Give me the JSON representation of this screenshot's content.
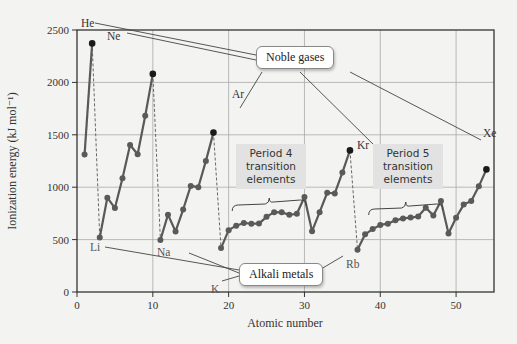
{
  "chart_data": {
    "type": "line",
    "title": "",
    "xlabel": "Atomic number",
    "ylabel": "Ionization energy (kJ mol⁻¹)",
    "xlim": [
      0,
      55
    ],
    "ylim": [
      0,
      2500
    ],
    "x_ticks": [
      0,
      10,
      20,
      30,
      40,
      50
    ],
    "y_ticks": [
      0,
      500,
      1000,
      1500,
      2000,
      2500
    ],
    "grid": true,
    "x": [
      1,
      2,
      3,
      4,
      5,
      6,
      7,
      8,
      9,
      10,
      11,
      12,
      13,
      14,
      15,
      16,
      17,
      18,
      19,
      20,
      21,
      22,
      23,
      24,
      25,
      26,
      27,
      28,
      29,
      30,
      31,
      32,
      33,
      34,
      35,
      36,
      37,
      38,
      39,
      40,
      41,
      42,
      43,
      44,
      45,
      46,
      47,
      48,
      49,
      50,
      51,
      52,
      53,
      54
    ],
    "values": [
      1312,
      2372,
      520,
      900,
      801,
      1086,
      1402,
      1314,
      1681,
      2081,
      496,
      738,
      578,
      787,
      1012,
      1000,
      1251,
      1521,
      419,
      590,
      633,
      659,
      651,
      653,
      717,
      762,
      760,
      737,
      746,
      906,
      579,
      762,
      947,
      941,
      1140,
      1351,
      403,
      550,
      600,
      640,
      652,
      684,
      702,
      710,
      720,
      804,
      731,
      868,
      558,
      709,
      834,
      869,
      1008,
      1170
    ],
    "segments": [
      [
        1,
        2
      ],
      [
        3,
        10
      ],
      [
        11,
        18
      ],
      [
        19,
        36
      ],
      [
        37,
        54
      ]
    ],
    "dashed_drops": [
      [
        2,
        3
      ],
      [
        10,
        11
      ],
      [
        18,
        19
      ],
      [
        36,
        37
      ]
    ],
    "noble_gases": [
      {
        "symbol": "He",
        "z": 2
      },
      {
        "symbol": "Ne",
        "z": 10
      },
      {
        "symbol": "Ar",
        "z": 18
      },
      {
        "symbol": "Kr",
        "z": 36
      },
      {
        "symbol": "Xe",
        "z": 54
      }
    ],
    "alkali_metals": [
      {
        "symbol": "Li",
        "z": 3
      },
      {
        "symbol": "Na",
        "z": 11
      },
      {
        "symbol": "K",
        "z": 19
      },
      {
        "symbol": "Rb",
        "z": 37
      }
    ],
    "annotations": {
      "noble_gases_label": "Noble gases",
      "alkali_metals_label": "Alkali metals",
      "period4_label": [
        "Period 4",
        "transition",
        "elements"
      ],
      "period5_label": [
        "Period 5",
        "transition",
        "elements"
      ],
      "period4_range": [
        21,
        30
      ],
      "period5_range": [
        39,
        48
      ]
    },
    "colors": {
      "line": "#595959",
      "marker": "#5a5a5a",
      "peak_marker": "#1a1a1a",
      "grid": "#aaaaaa",
      "callout_fill": "#e2e2e2"
    }
  }
}
